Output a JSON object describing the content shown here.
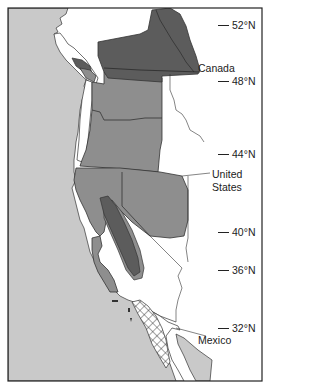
{
  "map": {
    "type": "regional distribution map",
    "region": "Pacific coast of North America",
    "colors": {
      "ocean": "#c9c9c9",
      "land": "#ffffff",
      "mid_shade": "#8e8e8e",
      "dark_shade": "#5c5c5c",
      "mexico_mainland": "#c9c9c9",
      "outline": "#333333",
      "hatch": "#333333"
    },
    "latitude_ticks": [
      {
        "label": "52°N"
      },
      {
        "label": "48°N"
      },
      {
        "label": "44°N"
      },
      {
        "label": "40°N"
      },
      {
        "label": "36°N"
      },
      {
        "label": "32°N"
      }
    ],
    "region_labels": {
      "canada": "Canada",
      "united_states_line1": "United",
      "united_states_line2": "States",
      "mexico": "Mexico"
    },
    "legend_shading": {
      "dark": "darkest range (interior BC / Sierra Nevada)",
      "mid": "medium range (WA, OR, N. California, Nevada, S. coast)",
      "hatched": "cross-hatched range (Baja California Pacific coast)"
    }
  }
}
